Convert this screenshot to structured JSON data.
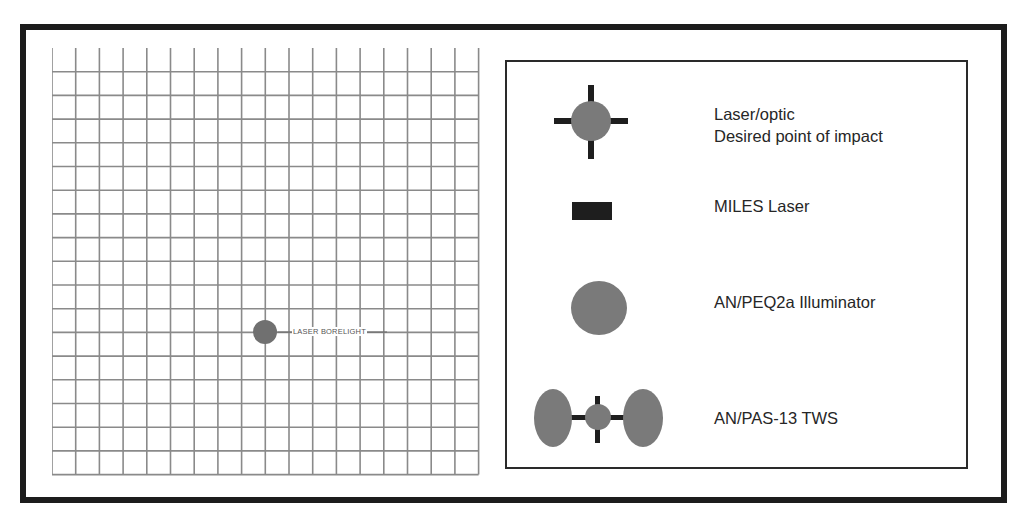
{
  "grid": {
    "columns": 18,
    "rows": 18,
    "cell_size_px": 23.7,
    "line_color": "#8a8a8a",
    "marker": {
      "label": "LASER BORELIGHT",
      "color": "#707070",
      "column_line": 9,
      "row_line": 12
    }
  },
  "legend": {
    "items": [
      {
        "symbol": "crosshair-circle-icon",
        "line1": "Laser/optic",
        "line2": "Desired point of impact"
      },
      {
        "symbol": "filled-rectangle-icon",
        "line1": "MILES Laser"
      },
      {
        "symbol": "filled-circle-icon",
        "line1": "AN/PEQ2a Illuminator"
      },
      {
        "symbol": "tws-dual-ellipse-icon",
        "line1": "AN/PAS-13 TWS"
      }
    ]
  },
  "colors": {
    "frame": "#1c1c1c",
    "symbol_fill": "#7a7a7a",
    "symbol_dark": "#1e1e1e",
    "text": "#262626"
  }
}
